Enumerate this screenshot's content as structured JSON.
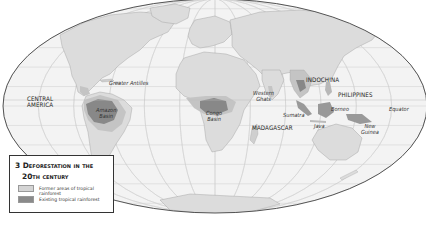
{
  "map": {
    "projection": "world-ellipse",
    "colors": {
      "ocean": "#f3f3f3",
      "land": "#dcdcdc",
      "former_rainforest": "#c4c4c4",
      "existing_rainforest": "#888888",
      "graticule": "#c8c8c8",
      "outline": "#444444"
    },
    "labels": {
      "central_america": [
        "CENTRAL",
        "AMERICA"
      ],
      "greater_antilles": "Greater Antilles",
      "amazon_basin": [
        "Amazon",
        "Basin"
      ],
      "congo_basin": [
        "Congo",
        "Basin"
      ],
      "western_ghats": [
        "Western",
        "Ghats"
      ],
      "madagascar": "MADAGASCAR",
      "indochina": "INDOCHINA",
      "philippines": "PHILIPPINES",
      "sumatra": "Sumatra",
      "borneo": "Borneo",
      "java": "Java",
      "new_guinea": [
        "New",
        "Guinea"
      ],
      "equator": "Equator"
    }
  },
  "legend": {
    "number": "3",
    "title_line1": "3 Deforestation in the",
    "title_line2": "20th century",
    "items": [
      {
        "label": "Former areas of tropical rainforest",
        "color": "#d4d4d4"
      },
      {
        "label": "Existing tropical rainforest",
        "color": "#8a8a8a"
      }
    ]
  }
}
